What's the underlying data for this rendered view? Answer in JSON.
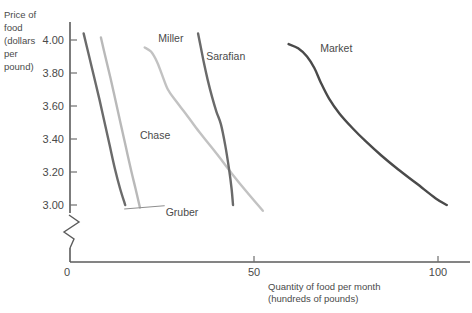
{
  "chart_data": {
    "type": "line",
    "title": "",
    "subtitle": "",
    "xlabel_line1": "Quantity of food per month",
    "xlabel_line2": "(hundreds of pounds)",
    "ylabel_lines": [
      "Price of",
      "food",
      "(dollars",
      "per",
      "pound)"
    ],
    "ylabel_full": "Price of food (dollars per pound)",
    "xlabel_full": "Quantity of food per month (hundreds of pounds)",
    "grid": false,
    "legend_position": "inline-annotations",
    "axis_break_y": true,
    "origin_label": "0",
    "xlim": [
      0,
      110
    ],
    "ylim": [
      2.9,
      4.08
    ],
    "xticks": [
      50,
      100
    ],
    "xtick_labels": [
      "50",
      "100"
    ],
    "yticks": [
      3.0,
      3.2,
      3.4,
      3.6,
      3.8,
      4.0
    ],
    "ytick_labels": [
      "3.00",
      "3.20",
      "3.40",
      "3.60",
      "3.80",
      "4.00"
    ],
    "series": [
      {
        "name": "Gruber",
        "color": "#6b6b6b",
        "width": 2.4,
        "label_x": 26,
        "label_y": 2.935,
        "leader": true,
        "x": [
          3.7,
          5.0,
          6.5,
          8.0,
          9.4,
          10.8,
          12.2,
          13.6,
          15.0
        ],
        "y": [
          4.04,
          3.92,
          3.78,
          3.64,
          3.5,
          3.36,
          3.22,
          3.1,
          3.0
        ]
      },
      {
        "name": "Chase",
        "color": "#b9b9b9",
        "width": 2.4,
        "label_x": 19,
        "label_y": 3.4,
        "leader": false,
        "x": [
          8.4,
          9.6,
          11.0,
          12.4,
          13.8,
          15.2,
          16.6,
          17.8,
          19.0
        ],
        "y": [
          4.015,
          3.9,
          3.77,
          3.63,
          3.49,
          3.35,
          3.21,
          3.1,
          2.985
        ]
      },
      {
        "name": "Miller",
        "color": "#c2c2c2",
        "width": 2.4,
        "label_x": 24,
        "label_y": 3.99,
        "leader": false,
        "x": [
          20.3,
          22.0,
          23.6,
          25.0,
          26.6,
          28.8,
          31.4,
          34.2,
          37.2,
          40.4,
          44.0,
          48.0,
          52.4
        ],
        "y": [
          3.955,
          3.93,
          3.87,
          3.79,
          3.7,
          3.63,
          3.555,
          3.47,
          3.385,
          3.295,
          3.19,
          3.08,
          2.965
        ]
      },
      {
        "name": "Sarafian",
        "color": "#6a6a6a",
        "width": 2.4,
        "label_x": 37,
        "label_y": 3.88,
        "leader": false,
        "x": [
          34.8,
          35.6,
          36.4,
          37.4,
          38.6,
          39.8,
          41.0,
          42.2,
          43.2,
          43.9,
          44.3
        ],
        "y": [
          4.04,
          3.95,
          3.86,
          3.76,
          3.655,
          3.565,
          3.49,
          3.36,
          3.22,
          3.1,
          3.0
        ]
      },
      {
        "name": "Market",
        "color": "#4a4a4a",
        "width": 2.4,
        "label_x": 68,
        "label_y": 3.93,
        "leader": false,
        "x": [
          59.4,
          62.0,
          64.4,
          66.4,
          68.2,
          70.4,
          73.2,
          76.6,
          80.4,
          84.6,
          89.2,
          94.2,
          99.4,
          102.4
        ],
        "y": [
          3.975,
          3.95,
          3.9,
          3.83,
          3.74,
          3.645,
          3.555,
          3.47,
          3.385,
          3.3,
          3.215,
          3.13,
          3.04,
          3.0
        ]
      }
    ]
  }
}
